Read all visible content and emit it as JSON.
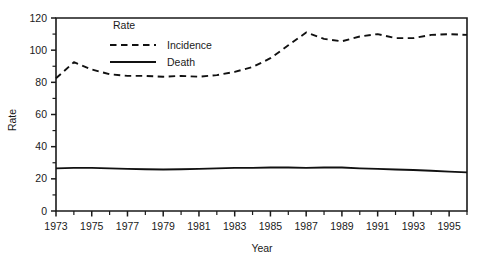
{
  "chart_data": {
    "type": "line",
    "title": "",
    "xlabel": "Year",
    "ylabel": "Rate",
    "xlim": [
      1973,
      1996
    ],
    "ylim": [
      0,
      120
    ],
    "grid": false,
    "legend_position": "inside-upper-left",
    "legend_title": "Rate",
    "y_ticks_major": [
      0,
      20,
      40,
      60,
      80,
      100,
      120
    ],
    "y_ticks_minor": [
      10,
      30,
      50,
      70,
      90,
      110
    ],
    "x_tick_labels": [
      "1973",
      "1975",
      "1977",
      "1979",
      "1981",
      "1983",
      "1985",
      "1987",
      "1989",
      "1991",
      "1993",
      "1995"
    ],
    "x_ticks_all": [
      1973,
      1974,
      1975,
      1976,
      1977,
      1978,
      1979,
      1980,
      1981,
      1982,
      1983,
      1984,
      1985,
      1986,
      1987,
      1988,
      1989,
      1990,
      1991,
      1992,
      1993,
      1994,
      1995,
      1996
    ],
    "x": [
      1973,
      1974,
      1975,
      1976,
      1977,
      1978,
      1979,
      1980,
      1981,
      1982,
      1983,
      1984,
      1985,
      1986,
      1987,
      1988,
      1989,
      1990,
      1991,
      1992,
      1993,
      1994,
      1995,
      1996
    ],
    "series": [
      {
        "name": "Incidence",
        "style": "dashed",
        "color": "#111111",
        "values": [
          82.5,
          92.5,
          88.0,
          85.0,
          84.0,
          84.0,
          83.5,
          84.0,
          83.5,
          84.5,
          86.5,
          89.5,
          95.0,
          103.0,
          111.0,
          107.0,
          105.5,
          108.5,
          110.0,
          107.5,
          107.5,
          109.5,
          110.0,
          109.5
        ]
      },
      {
        "name": "Death",
        "style": "solid",
        "color": "#111111",
        "values": [
          26.5,
          26.8,
          26.8,
          26.5,
          26.2,
          26.0,
          25.8,
          26.0,
          26.2,
          26.5,
          26.8,
          26.8,
          27.0,
          27.0,
          26.8,
          27.0,
          27.0,
          26.5,
          26.2,
          25.8,
          25.5,
          25.0,
          24.5,
          24.0
        ]
      }
    ]
  },
  "legend": {
    "title": "Rate",
    "items": [
      {
        "label": "Incidence",
        "style": "dashed"
      },
      {
        "label": "Death",
        "style": "solid"
      }
    ]
  },
  "axes": {
    "y_title": "Rate",
    "x_title": "Year"
  }
}
